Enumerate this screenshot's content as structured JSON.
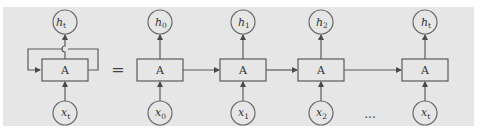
{
  "diagram": {
    "colors": {
      "panel": "#e6e6e6",
      "stroke": "#5a5a5a",
      "text": "#333333"
    },
    "folded": {
      "cell_label": "A",
      "output": {
        "var": "h",
        "sub": "t"
      },
      "input": {
        "var": "x",
        "sub": "t"
      },
      "has_recurrent_loop": true
    },
    "equals_sign": "=",
    "unrolled": [
      {
        "cell_label": "A",
        "output": {
          "var": "h",
          "sub": "0"
        },
        "input": {
          "var": "x",
          "sub": "0"
        }
      },
      {
        "cell_label": "A",
        "output": {
          "var": "h",
          "sub": "1"
        },
        "input": {
          "var": "x",
          "sub": "1"
        }
      },
      {
        "cell_label": "A",
        "output": {
          "var": "h",
          "sub": "2"
        },
        "input": {
          "var": "x",
          "sub": "2"
        }
      },
      {
        "cell_label": "A",
        "output": {
          "var": "h",
          "sub": "t"
        },
        "input": {
          "var": "x",
          "sub": "t"
        }
      }
    ],
    "ellipsis": "..."
  }
}
